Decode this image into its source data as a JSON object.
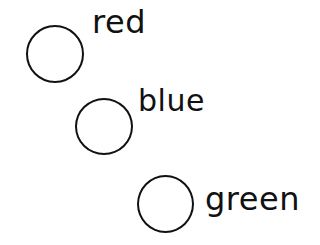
{
  "options": [
    {
      "label": "red",
      "circle": {
        "x": 26,
        "y": 25,
        "w": 58,
        "h": 58
      },
      "text": {
        "x": 92,
        "y": 6,
        "size": 32
      }
    },
    {
      "label": "blue",
      "circle": {
        "x": 75,
        "y": 98,
        "w": 58,
        "h": 57
      },
      "text": {
        "x": 138,
        "y": 86,
        "size": 30
      }
    },
    {
      "label": "green",
      "circle": {
        "x": 137,
        "y": 175,
        "w": 57,
        "h": 58
      },
      "text": {
        "x": 205,
        "y": 183,
        "size": 32
      }
    }
  ]
}
